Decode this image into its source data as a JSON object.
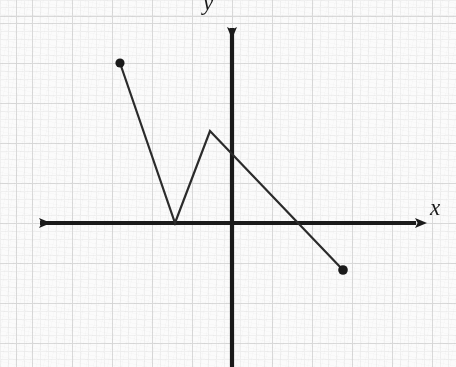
{
  "figure": {
    "background_color": "#fbfbfb",
    "grid_color_minor": "#ededed",
    "grid_color_major": "#d9d9d9",
    "ink_color": "#1a1a1a",
    "x_axis_label": "x",
    "y_axis_label": "y"
  },
  "chart_data": {
    "type": "line",
    "title": "",
    "xlabel": "x",
    "ylabel": "y",
    "grid": true,
    "legend": "none",
    "axes": {
      "origin_px": [
        232,
        223
      ],
      "unit_px": 40,
      "xlim": [
        -5.1,
        4.9
      ],
      "ylim": [
        -3.6,
        5.2
      ],
      "x_axis_arrows": "both",
      "y_axis_arrows": "up",
      "tick_labels_x": [],
      "tick_labels_y": []
    },
    "series": [
      {
        "name": "piecewise-linear-function",
        "closed_endpoints": [
          [
            -2.8,
            4.0
          ],
          [
            2.78,
            -1.18
          ]
        ],
        "vertices": [
          [
            -2.8,
            4.0
          ],
          [
            -1.42,
            0.0
          ],
          [
            -0.55,
            2.3
          ],
          [
            2.78,
            -1.18
          ]
        ],
        "vertices_px": [
          [
            120,
            63
          ],
          [
            175,
            223
          ],
          [
            210,
            131
          ],
          [
            343,
            270
          ]
        ],
        "x": [
          -2.8,
          -1.42,
          -0.55,
          2.78
        ],
        "y": [
          4.0,
          0.0,
          2.3,
          -1.18
        ]
      }
    ],
    "annotations": []
  }
}
